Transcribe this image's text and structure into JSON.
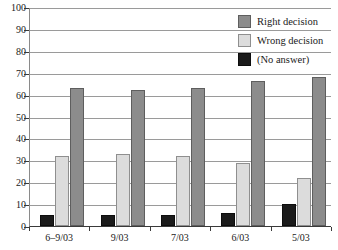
{
  "chart_data": {
    "type": "bar",
    "title": "",
    "subtitle": "",
    "xlabel": "",
    "ylabel": "",
    "ylim": [
      0,
      100
    ],
    "yticks": [
      0,
      10,
      20,
      30,
      40,
      50,
      60,
      70,
      80,
      90,
      100
    ],
    "grid": true,
    "legend_position": "top-right",
    "categories": [
      "6–9/03",
      "9/03",
      "7/03",
      "6/03",
      "5/03"
    ],
    "series": [
      {
        "name": "(No answer)",
        "color": "#1b1b1b",
        "values": [
          5,
          5,
          5,
          6,
          10
        ]
      },
      {
        "name": "Wrong decision",
        "color": "#dcdcdc",
        "values": [
          32,
          33,
          32,
          29,
          22
        ]
      },
      {
        "name": "Right decision",
        "color": "#8c8c8c",
        "values": [
          63,
          62,
          63,
          66,
          68
        ]
      }
    ]
  },
  "legend": {
    "items": [
      {
        "label": "Right decision",
        "swatch": "right"
      },
      {
        "label": "Wrong decision",
        "swatch": "wrong"
      },
      {
        "label": "(No answer)",
        "swatch": "noanswer"
      }
    ]
  },
  "axis": {
    "y_tick_labels": [
      "100",
      "90",
      "80",
      "70",
      "60",
      "50",
      "40",
      "30",
      "20",
      "10",
      "0"
    ],
    "x_tick_labels": [
      "6–9/03",
      "9/03",
      "7/03",
      "6/03",
      "5/03"
    ]
  },
  "colors": {
    "right_decision": "#8c8c8c",
    "wrong_decision": "#dcdcdc",
    "no_answer": "#1b1b1b",
    "gridline": "#9a9a9a",
    "axis": "#3a3a3a",
    "background": "#ffffff"
  }
}
